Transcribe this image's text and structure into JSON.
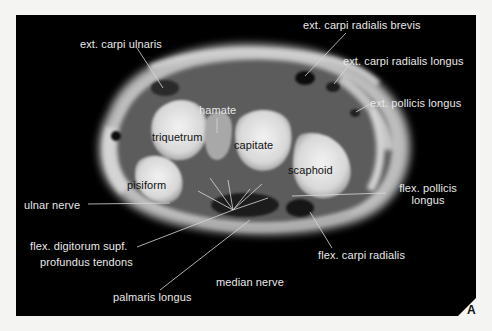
{
  "figure": {
    "panel_letter": "A",
    "background_color": "#f4f4f2",
    "panel_color": "#000000",
    "labels": {
      "ext_carpi_ulnaris": "ext. carpi  ulnaris",
      "ext_carpi_radialis_brevis": "ext. carpi radialis brevis",
      "ext_carpi_radialis_longus": "ext. carpi  radialis longus",
      "ext_pollicis_longus": "ext. pollicis longus",
      "hamate": "hamate",
      "triquetrum": "triquetrum",
      "capitate": "capitate",
      "scaphoid": "scaphoid",
      "pisiform": "pisiform",
      "ulnar_nerve": "ulnar  nerve",
      "flex_pollicis_longus_1": "flex. pollicis",
      "flex_pollicis_longus_2": "longus",
      "flex_digitorum_1": "flex. digitorum  supf.",
      "flex_digitorum_2": "profundus  tendons",
      "flex_carpi_radialis": "flex. carpi radialis",
      "median_nerve": "median  nerve",
      "palmaris_longus": "palmaris longus"
    },
    "leader_lines": [
      {
        "name": "ext-carpi-ulnaris-line",
        "x1": 137,
        "y1": 48,
        "x2": 163,
        "y2": 88
      },
      {
        "name": "ext-carpi-radialis-brevis-line",
        "x1": 346,
        "y1": 33,
        "x2": 305,
        "y2": 76
      },
      {
        "name": "ext-carpi-radialis-longus-line",
        "x1": 349,
        "y1": 65,
        "x2": 334,
        "y2": 84
      },
      {
        "name": "ext-pollicis-longus-line",
        "x1": 370,
        "y1": 104,
        "x2": 356,
        "y2": 112
      },
      {
        "name": "hamate-line",
        "x1": 217,
        "y1": 118,
        "x2": 217,
        "y2": 133
      },
      {
        "name": "ulnar-nerve-line",
        "x1": 88,
        "y1": 204,
        "x2": 170,
        "y2": 203
      },
      {
        "name": "flex-pollicis-longus-line",
        "x1": 386,
        "y1": 193,
        "x2": 292,
        "y2": 196
      },
      {
        "name": "flex-digitorum-line",
        "x1": 137,
        "y1": 247,
        "x2": 233,
        "y2": 210
      },
      {
        "name": "palmaris-longus-line",
        "x1": 160,
        "y1": 290,
        "x2": 250,
        "y2": 220
      },
      {
        "name": "flex-carpi-radialis-line",
        "x1": 332,
        "y1": 248,
        "x2": 310,
        "y2": 212
      },
      {
        "name": "radiating-line-1",
        "x1": 233,
        "y1": 210,
        "x2": 210,
        "y2": 178
      },
      {
        "name": "radiating-line-2",
        "x1": 233,
        "y1": 210,
        "x2": 198,
        "y2": 191
      },
      {
        "name": "radiating-line-3",
        "x1": 233,
        "y1": 210,
        "x2": 228,
        "y2": 180
      },
      {
        "name": "radiating-line-4",
        "x1": 233,
        "y1": 210,
        "x2": 262,
        "y2": 184
      },
      {
        "name": "radiating-line-5",
        "x1": 233,
        "y1": 210,
        "x2": 268,
        "y2": 198
      },
      {
        "name": "radiating-line-6",
        "x1": 233,
        "y1": 210,
        "x2": 250,
        "y2": 189
      }
    ]
  }
}
